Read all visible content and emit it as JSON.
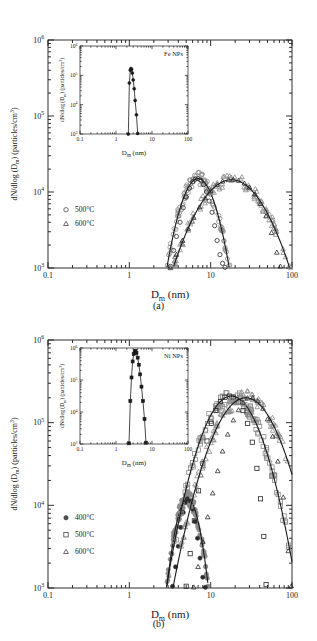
{
  "figure": {
    "caption_a": "(a)",
    "caption_b": "(b)",
    "axis_x_label_main": "D",
    "axis_x_label_sub": "m",
    "axis_x_label_unit": " (nm)",
    "axis_y_label_pre": "dN/dlog (D",
    "axis_y_label_sub": "m",
    "axis_y_label_post": ") (particles/cm",
    "axis_y_label_exp": "3",
    "axis_y_label_end": ")"
  },
  "xticks": {
    "labels": [
      "0.1",
      "1",
      "10",
      "100"
    ],
    "values": [
      0.1,
      1,
      10,
      100
    ]
  },
  "yticks": {
    "labels": [
      "10",
      "10",
      "10",
      "10"
    ],
    "exponents": [
      "3",
      "4",
      "5",
      "6"
    ],
    "values": [
      1000,
      10000,
      100000,
      1000000
    ]
  },
  "chart_data": [
    {
      "type": "line",
      "panel": "a",
      "title": "",
      "xlabel": "D_m (nm)",
      "ylabel": "dN/dlog (D_m) (particles/cm3)",
      "xscale": "log",
      "yscale": "log",
      "xlim": [
        0.1,
        100
      ],
      "ylim": [
        1000,
        1000000
      ],
      "grid": false,
      "legend_position": "left-lower",
      "legend": [
        {
          "label": "500°C",
          "marker": "circle"
        },
        {
          "label": "600°C",
          "marker": "triangle"
        }
      ],
      "series": [
        {
          "name": "500°C",
          "marker": "circle",
          "peak_x": 7.0,
          "peak_y": 15000,
          "sigma_log": 0.165,
          "x": [
            3.2,
            3.5,
            3.8,
            4.2,
            4.6,
            5.0,
            5.5,
            6.0,
            6.5,
            7.0,
            7.6,
            8.2,
            8.9,
            9.6,
            10.4,
            11.2,
            12.0,
            13.0,
            14.0,
            15.0
          ],
          "y": [
            1050,
            1700,
            2600,
            4000,
            6200,
            8600,
            11200,
            13600,
            14800,
            15000,
            14200,
            12500,
            10000,
            7600,
            5400,
            3600,
            2300,
            1500,
            1150,
            1020
          ]
        },
        {
          "name": "600°C",
          "marker": "triangle",
          "peak_x": 18.0,
          "peak_y": 14500,
          "sigma_log": 0.31,
          "x": [
            3.2,
            3.8,
            4.5,
            5.3,
            6.2,
            7.3,
            8.6,
            10.0,
            12.0,
            14.0,
            16.5,
            19.0,
            22.0,
            26.0,
            30.0,
            35.0,
            41.0,
            48.0,
            56.0,
            65.0,
            72.0
          ],
          "y": [
            1000,
            1500,
            2300,
            3300,
            4600,
            6300,
            8300,
            10300,
            12500,
            13800,
            14400,
            14500,
            14100,
            13000,
            11500,
            9400,
            7000,
            4800,
            2900,
            1600,
            1050
          ]
        }
      ]
    },
    {
      "type": "line",
      "panel": "a-inset",
      "title": "Fe NPs",
      "xlabel": "D_m (nm)",
      "ylabel": "dN/dlog (D_m) (particles/cm3)",
      "xscale": "log",
      "yscale": "log",
      "xlim": [
        0.1,
        100
      ],
      "ylim": [
        1000,
        1000000
      ],
      "grid": false,
      "series": [
        {
          "name": "Fe NPs",
          "marker": "filled-circle",
          "peak_x": 2.6,
          "peak_y": 170000,
          "x": [
            2.2,
            2.35,
            2.5,
            2.6,
            2.7,
            2.85,
            3.0,
            3.2,
            3.4,
            3.7,
            4.0
          ],
          "y": [
            1000,
            55000,
            150000,
            170000,
            160000,
            120000,
            70000,
            35000,
            14000,
            4500,
            1050
          ]
        }
      ]
    },
    {
      "type": "line",
      "panel": "b",
      "title": "",
      "xlabel": "D_m (nm)",
      "ylabel": "dN/dlog (D_m) (particles/cm3)",
      "xscale": "log",
      "yscale": "log",
      "xlim": [
        0.1,
        100
      ],
      "ylim": [
        1000,
        1000000
      ],
      "grid": false,
      "legend_position": "left-lower",
      "legend": [
        {
          "label": "400°C",
          "marker": "filled-circle"
        },
        {
          "label": "500°C",
          "marker": "square"
        },
        {
          "label": "600°C",
          "marker": "triangle"
        }
      ],
      "series": [
        {
          "name": "400°C",
          "marker": "filled-circle",
          "peak_x": 5.2,
          "peak_y": 12000,
          "sigma_log": 0.115,
          "x": [
            3.4,
            3.7,
            4.0,
            4.3,
            4.6,
            4.9,
            5.2,
            5.6,
            6.0,
            6.4,
            6.9,
            7.4,
            8.0,
            8.6
          ],
          "y": [
            1050,
            1800,
            3200,
            5400,
            8200,
            10800,
            12000,
            11200,
            9000,
            6400,
            4000,
            2300,
            1350,
            1020
          ]
        },
        {
          "name": "500°C",
          "marker": "square",
          "peak_x": 18.0,
          "peak_y": 210000,
          "sigma_log": 0.245,
          "x": [
            5.0,
            5.6,
            6.3,
            7.1,
            8.0,
            9.0,
            10.2,
            11.6,
            13.2,
            15.0,
            17.0,
            19.0,
            22.0,
            25.0,
            28.5,
            32.5,
            37.0,
            41.0,
            45.0,
            48.0
          ],
          "y": [
            1050,
            2600,
            6500,
            15000,
            32000,
            60000,
            98000,
            140000,
            180000,
            203000,
            210000,
            204000,
            178000,
            140000,
            98000,
            58000,
            28000,
            12000,
            4200,
            1100
          ]
        },
        {
          "name": "600°C",
          "marker": "triangle",
          "peak_x": 27.0,
          "peak_y": 200000,
          "sigma_log": 0.275,
          "x": [
            6.2,
            7.0,
            8.0,
            9.2,
            10.6,
            12.2,
            14.0,
            16.2,
            19.0,
            22.0,
            25.0,
            28.5,
            33.0,
            38.0,
            44.0,
            50.0,
            58.0,
            67.0,
            78.0,
            90.0,
            98.0
          ],
          "y": [
            1020,
            1800,
            3600,
            7200,
            14000,
            26000,
            45000,
            72000,
            107000,
            142000,
            175000,
            198000,
            200000,
            183000,
            148000,
            110000,
            68000,
            34000,
            12500,
            2800,
            1050
          ]
        }
      ]
    },
    {
      "type": "line",
      "panel": "b-inset",
      "title": "Ni NPs",
      "xlabel": "D_m (nm)",
      "ylabel": "dN/dlog (D_m) (particles/cm3)",
      "xscale": "log",
      "yscale": "log",
      "xlim": [
        0.1,
        100
      ],
      "ylim": [
        1000,
        1000000
      ],
      "grid": false,
      "series": [
        {
          "name": "Ni NPs",
          "marker": "filled-square",
          "peak_x": 3.4,
          "peak_y": 800000,
          "x": [
            2.3,
            2.5,
            2.7,
            2.9,
            3.1,
            3.3,
            3.5,
            3.7,
            4.0,
            4.3,
            4.7,
            5.1,
            5.6,
            6.2,
            6.8
          ],
          "y": [
            1050,
            22000,
            120000,
            380000,
            650000,
            790000,
            800000,
            700000,
            500000,
            300000,
            150000,
            62000,
            22000,
            6000,
            1100
          ]
        }
      ]
    }
  ]
}
